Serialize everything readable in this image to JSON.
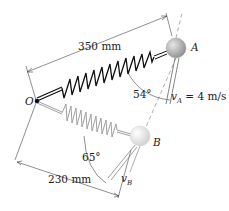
{
  "diagram": {
    "type": "mechanics-spring-mass",
    "pivot": {
      "label": "O"
    },
    "mass_a": {
      "label": "A",
      "color": "#b8b8b8"
    },
    "mass_b": {
      "label": "B",
      "color": "#e8e8e8"
    },
    "dimensions": {
      "length_a": "350 mm",
      "length_b": "230 mm"
    },
    "angles": {
      "angle_a": "54°",
      "angle_b": "65°"
    },
    "velocities": {
      "va_symbol": "v",
      "va_sub": "A",
      "va_value": " = 4 m/s",
      "vb_symbol": "v",
      "vb_sub": "B"
    },
    "colors": {
      "spring_a": "#111111",
      "spring_b": "#9a9a9a",
      "line": "#555555"
    }
  }
}
